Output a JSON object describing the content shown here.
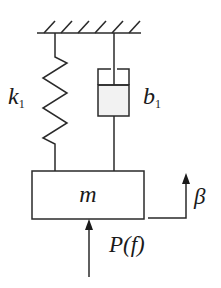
{
  "diagram": {
    "ground": {
      "label": "fixed support"
    },
    "spring": {
      "symbol": "k",
      "subscript": "1"
    },
    "damper": {
      "symbol": "b",
      "subscript": "1"
    },
    "mass": {
      "label": "m"
    },
    "displacement": {
      "label": "β"
    },
    "force": {
      "label": "P(f)"
    },
    "colors": {
      "line": "#2a2a2a",
      "damper_fill": "#f2f2f2",
      "background": "#ffffff"
    }
  }
}
